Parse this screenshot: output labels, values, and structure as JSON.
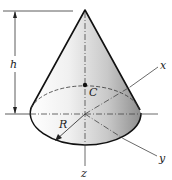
{
  "figure": {
    "labels": {
      "height": "h",
      "centroid": "C",
      "radius": "R",
      "x_axis": "x",
      "y_axis": "y",
      "z_axis": "z"
    },
    "colors": {
      "outline": "#111111",
      "axis": "#555555",
      "shade_light": "#f4f4f4",
      "shade_dark": "#9a9a9a"
    }
  }
}
